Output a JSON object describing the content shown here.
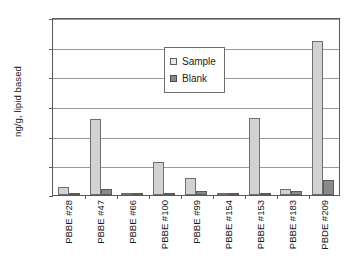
{
  "chart_data": {
    "type": "bar",
    "title": "",
    "xlabel": "",
    "ylabel": "ng/g, lipid based",
    "ylim": [
      0,
      1.2
    ],
    "ytick_labels": [
      "1.2",
      "1.0",
      "0.8",
      "0.6",
      "0.4",
      "0.2",
      "0"
    ],
    "ytick_values": [
      1.2,
      1.0,
      0.8,
      0.6,
      0.4,
      0.2,
      0
    ],
    "grid": "horizontal",
    "legend_position": "upper-center-right-inside",
    "categories": [
      "PBBE #28",
      "PBBE #47",
      "PBBE #66",
      "PBBE #100",
      "PBBE #99",
      "PBBE #154",
      "PBBE #153",
      "PBBE #183",
      "PBDE #209"
    ],
    "series": [
      {
        "name": "Sample",
        "color": "#d2d2d2",
        "values": [
          0.055,
          0.515,
          0.012,
          0.225,
          0.115,
          0.016,
          0.52,
          0.04,
          1.04
        ]
      },
      {
        "name": "Blank",
        "color": "#8a8a8a",
        "values": [
          0.005,
          0.043,
          0.004,
          0.006,
          0.03,
          0.003,
          0.007,
          0.025,
          0.103
        ]
      }
    ]
  },
  "legend": {
    "items": [
      {
        "label": "Sample"
      },
      {
        "label": "Blank"
      }
    ]
  }
}
